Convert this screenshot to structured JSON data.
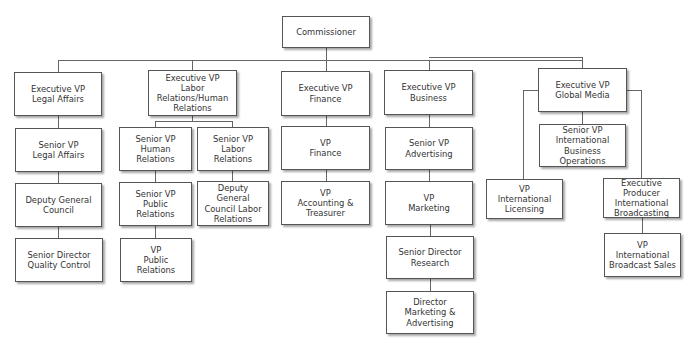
{
  "diagram": {
    "type": "org-chart",
    "root": "Commissioner",
    "nodes": [
      {
        "id": "commissioner",
        "label": "Commissioner"
      },
      {
        "id": "evp_legal",
        "label": "Executive VP\nLegal Affairs"
      },
      {
        "id": "evp_labor",
        "label": "Executive VP\nLabor\nRelations/Human\nRelations"
      },
      {
        "id": "evp_finance",
        "label": "Executive VP\nFinance"
      },
      {
        "id": "evp_business",
        "label": "Executive VP\nBusiness"
      },
      {
        "id": "evp_global",
        "label": "Executive VP\nGlobal Media"
      },
      {
        "id": "svp_legal",
        "label": "Senior VP\nLegal Affairs"
      },
      {
        "id": "deputy_gc",
        "label": "Deputy General\nCouncil"
      },
      {
        "id": "sd_quality",
        "label": "Senior Director\nQuality Control"
      },
      {
        "id": "svp_human",
        "label": "Senior VP\nHuman\nRelations"
      },
      {
        "id": "svp_labor",
        "label": "Senior VP\nLabor\nRelations"
      },
      {
        "id": "svp_public",
        "label": "Senior VP\nPublic Relations"
      },
      {
        "id": "deputy_gc_labor",
        "label": "Deputy\nGeneral\nCouncil Labor\nRelations"
      },
      {
        "id": "vp_public",
        "label": "VP\nPublic\nRelations"
      },
      {
        "id": "vp_finance",
        "label": "VP\nFinance"
      },
      {
        "id": "vp_accounting",
        "label": "VP\nAccounting &\nTreasurer"
      },
      {
        "id": "svp_advertising",
        "label": "Senior  VP\nAdvertising"
      },
      {
        "id": "vp_marketing",
        "label": "VP\nMarketing"
      },
      {
        "id": "sd_research",
        "label": "Senior Director\nResearch"
      },
      {
        "id": "dir_mkt_adv",
        "label": "Director\nMarketing &\nAdvertising"
      },
      {
        "id": "svp_intl_bus",
        "label": "Senior VP\nInternational\nBusiness Operations"
      },
      {
        "id": "vp_intl_licensing",
        "label": "VP\nInternational\nLicensing"
      },
      {
        "id": "ep_intl_broadcasting",
        "label": "Executive\nProducer\nInternational\nBroadcasting"
      },
      {
        "id": "vp_intl_broadcast_sales",
        "label": "VP\nInternational\nBroadcast Sales"
      }
    ],
    "edges": [
      [
        "commissioner",
        "evp_legal"
      ],
      [
        "commissioner",
        "evp_labor"
      ],
      [
        "commissioner",
        "evp_finance"
      ],
      [
        "commissioner",
        "evp_business"
      ],
      [
        "commissioner",
        "evp_global"
      ],
      [
        "evp_legal",
        "svp_legal"
      ],
      [
        "svp_legal",
        "deputy_gc"
      ],
      [
        "deputy_gc",
        "sd_quality"
      ],
      [
        "evp_labor",
        "svp_human"
      ],
      [
        "evp_labor",
        "svp_labor"
      ],
      [
        "svp_human",
        "svp_public"
      ],
      [
        "svp_public",
        "vp_public"
      ],
      [
        "svp_labor",
        "deputy_gc_labor"
      ],
      [
        "evp_finance",
        "vp_finance"
      ],
      [
        "vp_finance",
        "vp_accounting"
      ],
      [
        "evp_business",
        "svp_advertising"
      ],
      [
        "svp_advertising",
        "vp_marketing"
      ],
      [
        "vp_marketing",
        "sd_research"
      ],
      [
        "sd_research",
        "dir_mkt_adv"
      ],
      [
        "evp_global",
        "svp_intl_bus"
      ],
      [
        "evp_global",
        "vp_intl_licensing"
      ],
      [
        "evp_global",
        "ep_intl_broadcasting"
      ],
      [
        "ep_intl_broadcasting",
        "vp_intl_broadcast_sales"
      ]
    ],
    "colors": {
      "line": "#666666",
      "box_border": "#555555",
      "text": "#333333",
      "background": "#ffffff"
    }
  }
}
